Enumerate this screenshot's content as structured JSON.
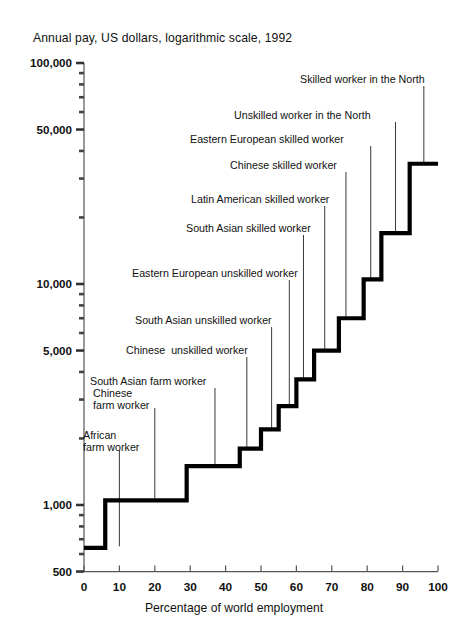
{
  "chart_data": {
    "type": "area",
    "title": "Annual pay, US dollars, logarithmic scale, 1992",
    "xlabel": "Percentage of world employment",
    "ylabel": "Annual pay, US dollars, logarithmic scale, 1992",
    "scale": "log",
    "grid": false,
    "legend": "none",
    "xlim": [
      0,
      100
    ],
    "ylim": [
      500,
      100000
    ],
    "xticks": [
      0,
      10,
      20,
      30,
      40,
      50,
      60,
      70,
      80,
      90,
      100
    ],
    "xtick_labels": [
      "0",
      "10",
      "20",
      "30",
      "40",
      "50",
      "60",
      "70",
      "80",
      "90",
      "100"
    ],
    "ytick_labels": [
      "100,000",
      "50,000",
      "10,000",
      "5,000",
      "1,000",
      "500"
    ],
    "yticks_major": [
      100000,
      50000,
      10000,
      5000,
      1000,
      500
    ],
    "yticks_minor": [
      90000,
      80000,
      70000,
      60000,
      40000,
      30000,
      20000,
      9000,
      8000,
      7000,
      6000,
      4000,
      3000,
      2000,
      900,
      800,
      700,
      600
    ],
    "series_name": "Annual pay by worker category",
    "steps": [
      {
        "label": "African\nfarm worker",
        "x_start": 0,
        "x_end": 6,
        "pay": 640,
        "leader_x": 10,
        "leader_top": 450,
        "label_x": 83,
        "label_y": 430
      },
      {
        "label": "Chinese\nfarm worker",
        "x_start": 6,
        "x_end": 29,
        "pay": 1050,
        "leader_x": 20,
        "leader_top": 408,
        "label_x": 93,
        "label_y": 388
      },
      {
        "label": "South Asian farm worker",
        "x_start": 29,
        "x_end": 44,
        "pay": 1500,
        "leader_x": 37,
        "leader_top": 388,
        "label_x": 90,
        "label_y": 376
      },
      {
        "label": "Chinese  unskilled worker",
        "x_start": 44,
        "x_end": 50,
        "pay": 1800,
        "leader_x": 46,
        "leader_top": 357,
        "label_x": 126,
        "label_y": 345
      },
      {
        "label": "South Asian unskilled worker",
        "x_start": 50,
        "x_end": 55,
        "pay": 2200,
        "leader_x": 53,
        "leader_top": 327,
        "label_x": 135,
        "label_y": 315
      },
      {
        "label": "Eastern European unskilled worker",
        "x_start": 55,
        "x_end": 60,
        "pay": 2800,
        "leader_x": 58,
        "leader_top": 280,
        "label_x": 132,
        "label_y": 268
      },
      {
        "label": "South Asian skilled worker",
        "x_start": 60,
        "x_end": 65,
        "pay": 3700,
        "leader_x": 62,
        "leader_top": 235,
        "label_x": 186,
        "label_y": 223
      },
      {
        "label": "Latin American skilled worker",
        "x_start": 65,
        "x_end": 72,
        "pay": 5000,
        "leader_x": 68,
        "leader_top": 206,
        "label_x": 191,
        "label_y": 194
      },
      {
        "label": "Chinese skilled worker",
        "x_start": 72,
        "x_end": 79,
        "pay": 7000,
        "leader_x": 74,
        "leader_top": 172,
        "label_x": 230,
        "label_y": 160
      },
      {
        "label": "Eastern European skilled worker",
        "x_start": 79,
        "x_end": 84,
        "pay": 10500,
        "leader_x": 81,
        "leader_top": 146,
        "label_x": 190,
        "label_y": 134
      },
      {
        "label": "Unskilled worker in the North",
        "x_start": 84,
        "x_end": 92,
        "pay": 17000,
        "leader_x": 88,
        "leader_top": 122,
        "label_x": 234,
        "label_y": 110
      },
      {
        "label": "Skilled worker in the North",
        "x_start": 92,
        "x_end": 100,
        "pay": 35000,
        "leader_x": 96,
        "leader_top": 86,
        "label_x": 300,
        "label_y": 74
      }
    ],
    "colors": {
      "line": "#000000",
      "axis": "#555555",
      "text": "#111111",
      "background": "#ffffff"
    }
  }
}
